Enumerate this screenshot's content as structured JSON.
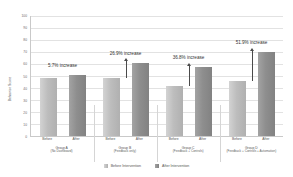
{
  "chart_data": {
    "type": "bar",
    "title": "",
    "xlabel": "",
    "ylabel": "Behavior Score",
    "ylim": [
      0,
      100
    ],
    "ytick_step": 10,
    "yticks": [
      "100",
      "90",
      "80",
      "70",
      "60",
      "50",
      "40",
      "30",
      "20",
      "10",
      "0"
    ],
    "grid": true,
    "legend_position": "bottom",
    "categories": [
      "Group A (No Dashboard)",
      "Group B (Feedback only)",
      "Group C (Feedback + Controls)",
      "Group D (Feedback + Controls + Automation)"
    ],
    "series": [
      {
        "name": "Before Intervention",
        "values": [
          48.0,
          48.0,
          42.0,
          46.0
        ]
      },
      {
        "name": "After Intervention",
        "values": [
          50.7,
          61.0,
          57.5,
          70.0
        ]
      }
    ],
    "annotations": [
      "5.7% increase",
      "26.9% increase",
      "36.8% increase",
      "51.9% increase"
    ]
  },
  "axis": {
    "y_title": "Behavior Score",
    "ticks": [
      {
        "label": "100",
        "value": 100
      },
      {
        "label": "90",
        "value": 90
      },
      {
        "label": "80",
        "value": 80
      },
      {
        "label": "70",
        "value": 70
      },
      {
        "label": "60",
        "value": 60
      },
      {
        "label": "50",
        "value": 50
      },
      {
        "label": "40",
        "value": 40
      },
      {
        "label": "30",
        "value": 30
      },
      {
        "label": "20",
        "value": 20
      },
      {
        "label": "10",
        "value": 10
      },
      {
        "label": "0",
        "value": 0
      }
    ]
  },
  "groups": [
    {
      "name": "Group A",
      "subtitle": "(No Dashboard)",
      "annotation": "5.7% increase",
      "has_arrow": false,
      "bars": [
        {
          "tick": "Before",
          "value": 48.0
        },
        {
          "tick": "After",
          "value": 50.7
        }
      ]
    },
    {
      "name": "Group B",
      "subtitle": "(Feedback only)",
      "annotation": "26.9% increase",
      "has_arrow": true,
      "bars": [
        {
          "tick": "Before",
          "value": 48.0
        },
        {
          "tick": "After",
          "value": 61.0
        }
      ]
    },
    {
      "name": "Group C",
      "subtitle": "(Feedback + Controls)",
      "annotation": "36.8% increase",
      "has_arrow": true,
      "bars": [
        {
          "tick": "Before",
          "value": 42.0
        },
        {
          "tick": "After",
          "value": 57.5
        }
      ]
    },
    {
      "name": "Group D",
      "subtitle": "(Feedback + Controls + Automation)",
      "annotation": "51.9% increase",
      "has_arrow": true,
      "bars": [
        {
          "tick": "Before",
          "value": 46.0
        },
        {
          "tick": "After",
          "value": 70.0
        }
      ]
    }
  ],
  "legend": [
    {
      "label": "Before Intervention",
      "swatch": "before",
      "color": "#bdbdbd"
    },
    {
      "label": "After Intervention",
      "swatch": "after",
      "color": "#8e8e8e"
    }
  ],
  "colors": {
    "bar_before": "#bdbdbd",
    "bar_after": "#8e8e8e",
    "gridline": "#e2e2e2",
    "axis": "#c9c9c9",
    "text": "#555555",
    "background": "#ffffff"
  }
}
